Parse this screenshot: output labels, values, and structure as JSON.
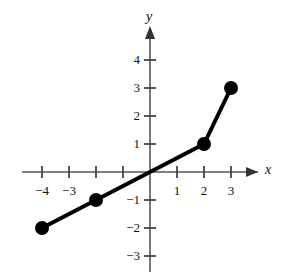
{
  "chart_data": {
    "type": "line",
    "title": "",
    "subtitle": "",
    "xlabel": "x",
    "ylabel": "y",
    "xlim": [
      -4.8,
      4.0
    ],
    "ylim": [
      -3.6,
      4.6
    ],
    "grid": false,
    "legend": "none",
    "style": {
      "background": "#ffffff",
      "line_color": "#000000",
      "axis_color": "#444444",
      "marker_color": "#000000",
      "line_width_px": 4,
      "marker_radius_px": 7
    },
    "series": [
      {
        "name": "piecewise-linear",
        "x": [
          -4,
          -2,
          2,
          3
        ],
        "y": [
          -2,
          -1,
          1,
          3
        ],
        "points": [
          {
            "label": "(-4, -2)",
            "x": -4,
            "y": -2,
            "marker": "filled-circle"
          },
          {
            "label": "(-2, -1)",
            "x": -2,
            "y": -1,
            "marker": "filled-circle"
          },
          {
            "label": "(2, 1)",
            "x": 2,
            "y": 1,
            "marker": "filled-circle"
          },
          {
            "label": "(3, 3)",
            "x": 3,
            "y": 3,
            "marker": "filled-circle"
          }
        ]
      }
    ],
    "x_ticks": [
      {
        "value": -4,
        "label": "−4",
        "labeled": true
      },
      {
        "value": -3,
        "label": "−3",
        "labeled": true
      },
      {
        "value": -2,
        "label": "",
        "labeled": false
      },
      {
        "value": -1,
        "label": "",
        "labeled": false
      },
      {
        "value": 1,
        "label": "1",
        "labeled": true
      },
      {
        "value": 2,
        "label": "2",
        "labeled": true
      },
      {
        "value": 3,
        "label": "3",
        "labeled": true
      }
    ],
    "y_ticks": [
      {
        "value": 4,
        "label": "4",
        "labeled": true
      },
      {
        "value": 3,
        "label": "3",
        "labeled": true
      },
      {
        "value": 2,
        "label": "2",
        "labeled": true
      },
      {
        "value": 1,
        "label": "1",
        "labeled": true
      },
      {
        "value": -1,
        "label": "−1",
        "labeled": true
      },
      {
        "value": -2,
        "label": "−2",
        "labeled": true
      },
      {
        "value": -3,
        "label": "−3",
        "labeled": true
      }
    ],
    "axes": {
      "x_axis_label": "x",
      "y_axis_label": "y",
      "x_arrow": "positive-end",
      "y_arrow": "positive-end",
      "origin_px": [
        150,
        172
      ],
      "unit_px_x": 27,
      "unit_px_y": 28
    }
  }
}
